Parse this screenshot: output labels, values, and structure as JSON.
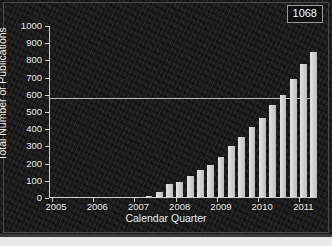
{
  "chart_data": {
    "type": "bar",
    "title": "",
    "xlabel": "Calendar Quarter",
    "ylabel": "Total Number of Publications",
    "ylim": [
      0,
      1000
    ],
    "yticks": [
      0,
      100,
      200,
      300,
      400,
      500,
      600,
      700,
      800,
      900,
      1000
    ],
    "ytick_labels": [
      "0",
      "100",
      "200",
      "300",
      "400",
      "500",
      "600",
      "700",
      "800",
      "900",
      "1000"
    ],
    "xtick_labels": [
      "2005",
      "2006",
      "2007",
      "2008",
      "2009",
      "2010",
      "2011"
    ],
    "grid": false,
    "legend": null,
    "annotations": [
      {
        "text": "1068",
        "position": "top-right"
      }
    ],
    "reference_line": {
      "y": 580,
      "orientation": "horizontal"
    },
    "categories": [
      "2005 Q1",
      "2005 Q2",
      "2005 Q3",
      "2005 Q4",
      "2006 Q1",
      "2006 Q2",
      "2006 Q3",
      "2006 Q4",
      "2007 Q1",
      "2007 Q2",
      "2007 Q3",
      "2007 Q4",
      "2008 Q1",
      "2008 Q2",
      "2008 Q3",
      "2008 Q4",
      "2009 Q1",
      "2009 Q2",
      "2009 Q3",
      "2009 Q4",
      "2010 Q1",
      "2010 Q2",
      "2010 Q3",
      "2010 Q4",
      "2011 Q1",
      "2011 Q2"
    ],
    "values": [
      0,
      0,
      0,
      0,
      0,
      0,
      0,
      0,
      5,
      10,
      35,
      80,
      95,
      130,
      160,
      190,
      240,
      300,
      355,
      415,
      468,
      538,
      600,
      690,
      780,
      850
    ]
  },
  "annotation": {
    "value": "1068"
  },
  "axes": {
    "y_title": "Total Number of Publications",
    "x_title": "Calendar Quarter"
  }
}
